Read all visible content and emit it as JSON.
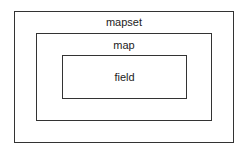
{
  "diagram": {
    "type": "nested-containment",
    "levels": [
      {
        "label": "mapset"
      },
      {
        "label": "map"
      },
      {
        "label": "field"
      }
    ]
  }
}
